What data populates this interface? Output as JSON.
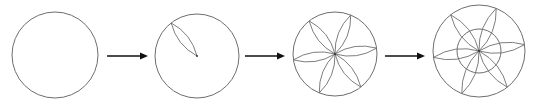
{
  "diagram": {
    "colors": {
      "line": "#6e6e6e",
      "arrow": "#111111",
      "background": "#ffffff"
    },
    "steps": [
      {
        "id": 1,
        "label": "empty circle",
        "cx": 55,
        "cy": 55,
        "r": 43,
        "petals": 0,
        "inner_circle": false
      },
      {
        "id": 2,
        "label": "one petal",
        "cx": 197,
        "cy": 56,
        "r": 42,
        "petals": 1,
        "inner_circle": false
      },
      {
        "id": 3,
        "label": "six petals",
        "cx": 335,
        "cy": 54,
        "r": 42,
        "petals": 6,
        "inner_circle": false
      },
      {
        "id": 4,
        "label": "six petals with inner circle",
        "cx": 479,
        "cy": 51,
        "r": 46,
        "petals": 6,
        "inner_circle": true,
        "inner_r": 22
      }
    ],
    "arrows": [
      {
        "from": 1,
        "to": 2,
        "x1": 107,
        "x2": 148,
        "y": 56
      },
      {
        "from": 2,
        "to": 3,
        "x1": 245,
        "x2": 285,
        "y": 56
      },
      {
        "from": 3,
        "to": 4,
        "x1": 385,
        "x2": 425,
        "y": 56
      }
    ]
  }
}
